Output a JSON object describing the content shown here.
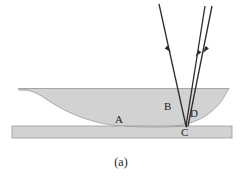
{
  "figure": {
    "caption": "(a)",
    "labels": {
      "A": "A",
      "B": "B",
      "C": "C",
      "D": "D"
    },
    "colors": {
      "lens_fill": "#d2d2d2",
      "lens_stroke": "#9a9a9a",
      "plate_fill": "#d2d2d2",
      "plate_stroke": "#9a9a9a",
      "ray_stroke": "#2b2b2b",
      "background": "#ffffff",
      "text": "#1b1b1b"
    },
    "elements": {
      "lens_name": "plano-convex-lens",
      "plate_name": "flat-glass-plate",
      "incident_ray_name": "incident-ray",
      "reflected_ray_1_name": "reflected-ray-inner",
      "reflected_ray_2_name": "reflected-ray-outer"
    }
  }
}
